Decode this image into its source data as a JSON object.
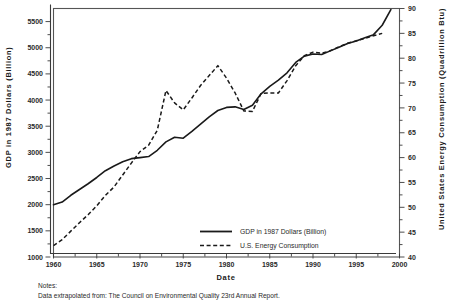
{
  "chart_data": {
    "type": "line",
    "title": "",
    "xlabel": "Date",
    "ylabel": "GDP in 1987 Dollars (Billion)",
    "y2label": "United States Energy Consumption (Quadrillion Btu)",
    "xlim": [
      1960,
      2000
    ],
    "ylim": [
      1000,
      5750
    ],
    "y2lim": [
      40,
      90
    ],
    "grid": false,
    "legend_position": "inside-lower-center",
    "xticks": [
      1960,
      1965,
      1970,
      1975,
      1980,
      1985,
      1990,
      1995,
      2000
    ],
    "xticklabels": [
      "1960",
      "1965",
      "1970",
      "1975",
      "1980",
      "1985",
      "1990",
      "1995",
      "2000"
    ],
    "yticks": [
      1000,
      1500,
      2000,
      2500,
      3000,
      3500,
      4000,
      4500,
      5000,
      5500
    ],
    "yticklabels": [
      "1000",
      "1500",
      "2000",
      "2500",
      "3000",
      "3500",
      "4000",
      "4500",
      "5000",
      "5500"
    ],
    "y2ticks": [
      40,
      45,
      50,
      55,
      60,
      65,
      70,
      75,
      80,
      85,
      90
    ],
    "y2ticklabels": [
      "40",
      "45",
      "50",
      "55",
      "60",
      "65",
      "70",
      "75",
      "80",
      "85",
      "90"
    ],
    "series": [
      {
        "name": "GDP in 1987 Dollars (Billion)",
        "style": "solid",
        "axis": "left",
        "x": [
          1960,
          1961,
          1962,
          1963,
          1964,
          1965,
          1966,
          1967,
          1968,
          1969,
          1970,
          1971,
          1972,
          1973,
          1974,
          1975,
          1976,
          1977,
          1978,
          1979,
          1980,
          1981,
          1982,
          1983,
          1984,
          1985,
          1986,
          1987,
          1988,
          1989,
          1990,
          1991,
          1992,
          1993,
          1994,
          1995,
          1996,
          1997,
          1998,
          1999
        ],
        "y": [
          2000,
          2050,
          2180,
          2290,
          2400,
          2520,
          2650,
          2740,
          2820,
          2880,
          2900,
          2920,
          3040,
          3200,
          3290,
          3270,
          3400,
          3540,
          3680,
          3800,
          3860,
          3870,
          3820,
          3900,
          4120,
          4260,
          4380,
          4520,
          4720,
          4840,
          4880,
          4870,
          4940,
          5010,
          5080,
          5130,
          5190,
          5250,
          5430,
          5730
        ]
      },
      {
        "name": "U.S. Energy Consumption",
        "style": "dashed",
        "axis": "right",
        "x": [
          1960,
          1961,
          1962,
          1963,
          1964,
          1965,
          1966,
          1967,
          1968,
          1969,
          1970,
          1971,
          1972,
          1973,
          1974,
          1975,
          1976,
          1977,
          1978,
          1979,
          1980,
          1981,
          1982,
          1983,
          1984,
          1985,
          1986,
          1987,
          1988,
          1989,
          1990,
          1991,
          1992,
          1993,
          1994,
          1995,
          1996,
          1997,
          1998
        ],
        "y": [
          42.3,
          43.5,
          45.2,
          46.9,
          48.5,
          50.3,
          52.4,
          54.1,
          56.5,
          58.9,
          61.2,
          62.5,
          65.5,
          73.5,
          71.0,
          69.6,
          72.0,
          74.5,
          76.5,
          78.5,
          76.0,
          73.0,
          69.4,
          69.3,
          72.9,
          73.0,
          73.0,
          75.5,
          78.5,
          80.5,
          81.2,
          81.0,
          81.5,
          82.3,
          83.0,
          83.5,
          84.0,
          84.5,
          85.0
        ]
      }
    ],
    "legend": [
      {
        "label": "GDP in 1987 Dollars (Billion)",
        "style": "solid"
      },
      {
        "label": "U.S. Energy Consumption",
        "style": "dashed"
      }
    ],
    "notes_heading": "Notes:",
    "notes_body": "Data extrapolated from:  The Council on Environmental Quality 23rd Annual Report."
  },
  "colors": {
    "line": "#1a1a1a",
    "frame": "#555555",
    "background": "#ffffff"
  }
}
